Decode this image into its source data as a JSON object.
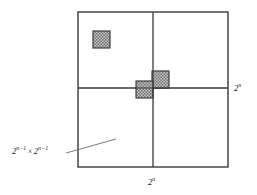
{
  "figure": {
    "labels": {
      "right_side": {
        "base": "2",
        "exponent": "n"
      },
      "bottom_side": {
        "base": "2",
        "exponent": "n"
      },
      "quadrant": {
        "first_base": "2",
        "first_exponent": "n−1",
        "times": "×",
        "second_base": "2",
        "second_exponent": "n−1"
      }
    },
    "colors": {
      "stroke": "#3a3a3a",
      "hatch_fill": "#9a9a9a",
      "hatch_line": "#4a4a4a",
      "background": "#ffffff",
      "text": "#1c1c1c",
      "leader": "#6b6b6b"
    },
    "geometry": {
      "outer_square": {
        "x": 78,
        "y": 12,
        "width": 150,
        "height": 155
      },
      "vertical_divider_x": 153,
      "horizontal_divider_y": 88,
      "shaded_squares": [
        {
          "name": "defective-square-top-left",
          "x": 93,
          "y": 31,
          "size": 17
        },
        {
          "name": "center-square-upper-right",
          "x": 152,
          "y": 71,
          "size": 17
        },
        {
          "name": "center-square-lower-left",
          "x": 136,
          "y": 81,
          "size": 17
        }
      ],
      "leader_line": {
        "x1": 66,
        "y1": 153,
        "x2": 116,
        "y2": 139
      },
      "label_positions": {
        "right_side": {
          "x": 234,
          "y": 82
        },
        "bottom_side": {
          "x": 148,
          "y": 176
        },
        "quadrant": {
          "x": 12,
          "y": 145
        }
      }
    }
  }
}
